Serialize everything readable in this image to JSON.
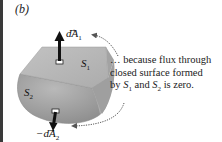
{
  "figure": {
    "panel_label": "(b)",
    "vectors": {
      "top": {
        "sign": "",
        "symbol": "dA",
        "subscript": "1"
      },
      "bottom": {
        "sign": "−",
        "symbol": "dA",
        "subscript": "2"
      }
    },
    "surfaces": {
      "s1": {
        "symbol": "S",
        "subscript": "1"
      },
      "s2": {
        "symbol": "S",
        "subscript": "2"
      }
    },
    "caption": {
      "line1": "… because flux through",
      "line2": "closed surface formed",
      "line3_prefix": "by ",
      "line3_s1": "S",
      "line3_s1_sub": "1",
      "line3_mid": " and ",
      "line3_s2": "S",
      "line3_s2_sub": "2",
      "line3_suffix": " is zero."
    },
    "colors": {
      "top_face": "#b4b4b4",
      "side_face": "#a6a6a6",
      "bottom_surface": "#9c9c9c",
      "arrow": "#111111",
      "dotted_arrow": "#555555"
    }
  }
}
